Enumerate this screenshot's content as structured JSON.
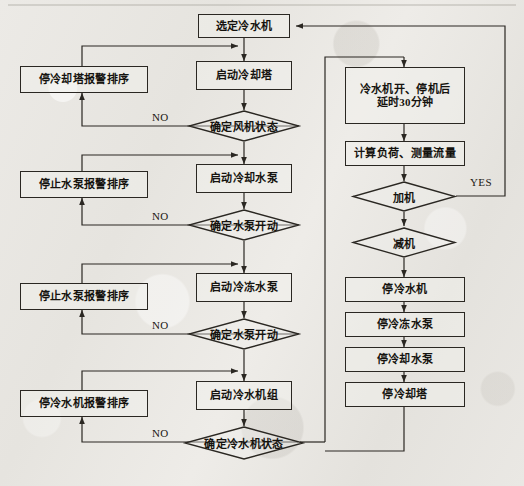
{
  "diagram": {
    "type": "flowchart",
    "canvas": {
      "width": 524,
      "height": 486
    },
    "colors": {
      "background": "#e8e7e3",
      "stroke": "#2a2722",
      "text": "#15130f"
    },
    "nodes": {
      "select_chiller": {
        "label": "选定冷水机",
        "shape": "box"
      },
      "start_cooling_tower": {
        "label": "启动冷却塔",
        "shape": "box"
      },
      "check_fan_status": {
        "label": "确定风机状态",
        "shape": "diamond"
      },
      "stop_tower_alarm": {
        "label": "停冷却塔报警排序",
        "shape": "box"
      },
      "start_cooling_pump": {
        "label": "启动冷却水泵",
        "shape": "box"
      },
      "check_pump_start_1": {
        "label": "确定水泵开动",
        "shape": "diamond"
      },
      "stop_pump_alarm_1": {
        "label": "停止水泵报警排序",
        "shape": "box"
      },
      "start_chilled_pump": {
        "label": "启动冷冻水泵",
        "shape": "box"
      },
      "check_pump_start_2": {
        "label": "确定水泵开动",
        "shape": "diamond"
      },
      "stop_pump_alarm_2": {
        "label": "停止水泵报警排序",
        "shape": "box"
      },
      "start_chiller_unit": {
        "label": "启动冷水机组",
        "shape": "box"
      },
      "check_chiller_status": {
        "label": "确定冷水机状态",
        "shape": "diamond"
      },
      "stop_chiller_alarm": {
        "label": "停冷水机报警排序",
        "shape": "box"
      },
      "delay_30min": {
        "label_line1": "冷水机开、停机后",
        "label_line2": "延时30分钟",
        "shape": "box"
      },
      "calc_load_flow": {
        "label": "计算负荷、测量流量",
        "shape": "box"
      },
      "add_machine": {
        "label": "加机",
        "shape": "diamond"
      },
      "reduce_machine": {
        "label": "减机",
        "shape": "diamond"
      },
      "stop_chiller": {
        "label": "停冷水机",
        "shape": "box"
      },
      "stop_chilled_pump": {
        "label": "停冷冻水泵",
        "shape": "box"
      },
      "stop_cooling_pump": {
        "label": "停冷却水泵",
        "shape": "box"
      },
      "stop_cooling_tower": {
        "label": "停冷却塔",
        "shape": "box"
      }
    },
    "edge_labels": {
      "no_1": "NO",
      "no_2": "NO",
      "no_3": "NO",
      "no_4": "NO",
      "yes_1": "YES"
    }
  }
}
